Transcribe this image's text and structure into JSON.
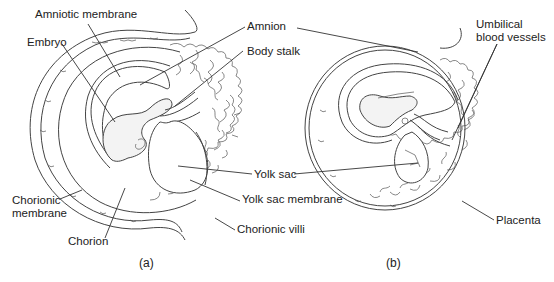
{
  "figure": {
    "panel_a": {
      "caption": "(a)",
      "labels": {
        "amniotic_membrane": "Amniotic membrane",
        "embryo": "Embryo",
        "amnion": "Amnion",
        "body_stalk": "Body stalk",
        "yolk_sac": "Yolk sac",
        "yolk_sac_membrane": "Yolk sac membrane",
        "chorionic_membrane": "Chorionic\nmembrane",
        "chorion": "Chorion",
        "chorionic_villi": "Chorionic villi"
      }
    },
    "panel_b": {
      "caption": "(b)",
      "labels": {
        "umbilical_blood_vessels": "Umbilical\nblood vessels",
        "placenta": "Placenta"
      }
    }
  }
}
